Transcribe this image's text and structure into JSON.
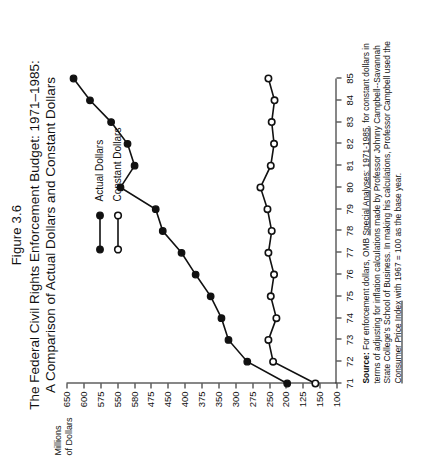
{
  "figure": {
    "number": "Figure 3.6",
    "title_line1": "The Federal Civil Rights Enforcement Budget: 1971–1985:",
    "title_line2": "A Comparison of Actual Dollars and Constant Dollars"
  },
  "axis": {
    "y_title_line1": "Millions",
    "y_title_line2": "of Dollars",
    "y_ticks": [
      "650",
      "600",
      "575",
      "550",
      "580",
      "475",
      "450",
      "400",
      "375",
      "350",
      "300",
      "275",
      "250",
      "200",
      "125",
      "150",
      "100"
    ],
    "x_ticks": [
      "71",
      "72",
      "73",
      "74",
      "75",
      "76",
      "77",
      "78",
      "79",
      "80",
      "81",
      "82",
      "83",
      "84",
      "85"
    ]
  },
  "legend": {
    "items": [
      {
        "label": "Actual Dollars",
        "marker": "filled-circle",
        "color": "#111111"
      },
      {
        "label": "Constant Dollars",
        "marker": "open-circle",
        "color": "#111111"
      }
    ]
  },
  "source": {
    "prefix": "Source:",
    "text_1": " For enforcement dollars, OMB ",
    "italic_1": "Special Analyses: 1971-1985",
    "text_2": ", for constant dollars in terms of adjusting for inflation calculations made by Professor Johnny Campbell--Savannah State College's School of Business. In making his calculations, Professor Campbell used the ",
    "italic_2": "Consumer Price Index",
    "text_3": " with 1967 = 100 as the base year."
  },
  "chart_data": {
    "type": "line",
    "title": "The Federal Civil Rights Enforcement Budget: 1971–1985: A Comparison of Actual Dollars and Constant Dollars",
    "xlabel": "",
    "ylabel": "Millions of Dollars",
    "x": [
      1971,
      1972,
      1973,
      1974,
      1975,
      1976,
      1977,
      1978,
      1979,
      1980,
      1981,
      1982,
      1983,
      1984,
      1985
    ],
    "x_tick_labels": [
      "71",
      "72",
      "73",
      "74",
      "75",
      "76",
      "77",
      "78",
      "79",
      "80",
      "81",
      "82",
      "83",
      "84",
      "85"
    ],
    "ylim": [
      100,
      675
    ],
    "grid": false,
    "legend_position": "upper-center-inside",
    "series": [
      {
        "name": "Actual Dollars",
        "marker": "filled-circle",
        "color": "#111111",
        "values": [
          205,
          290,
          330,
          345,
          368,
          400,
          430,
          470,
          485,
          560,
          530,
          545,
          580,
          625,
          660
        ]
      },
      {
        "name": "Constant Dollars",
        "marker": "open-circle",
        "color": "#111111",
        "values": [
          145,
          235,
          245,
          228,
          240,
          233,
          245,
          238,
          247,
          262,
          240,
          233,
          238,
          232,
          245
        ]
      }
    ]
  }
}
